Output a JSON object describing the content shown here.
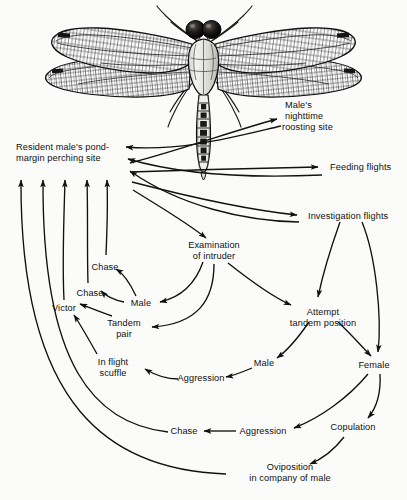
{
  "figure": {
    "type": "flow-diagram",
    "background_color": "#fbfbfa",
    "ink_color": "#111111"
  },
  "illustration": {
    "name": "dragonfly",
    "description": "Dorsal view line engraving of a dragonfly with four veined wings, dark compound eyes and a long segmented abdomen"
  },
  "nodes": [
    {
      "id": "perching",
      "lines": [
        "Resident male's pond-",
        "margin perching site"
      ],
      "x": 16,
      "y": 142,
      "align": "left"
    },
    {
      "id": "roosting",
      "lines": [
        "Male's",
        "nighttime",
        "roosting site"
      ],
      "x": 285,
      "y": 100,
      "align": "left"
    },
    {
      "id": "feeding",
      "lines": [
        "Feeding flights"
      ],
      "x": 330,
      "y": 165,
      "align": "left"
    },
    {
      "id": "investigation",
      "lines": [
        "Investigation flights"
      ],
      "x": 308,
      "y": 211,
      "align": "left"
    },
    {
      "id": "examination",
      "lines": [
        "Examination",
        "of intruder"
      ],
      "x": 214,
      "y": 245,
      "align": "center"
    },
    {
      "id": "chase_upper",
      "lines": [
        "Chase"
      ],
      "x": 105,
      "y": 262,
      "align": "center"
    },
    {
      "id": "chase_lower",
      "lines": [
        "Chase"
      ],
      "x": 90,
      "y": 290,
      "align": "center"
    },
    {
      "id": "victor",
      "lines": [
        "Victor"
      ],
      "x": 66,
      "y": 308,
      "align": "center"
    },
    {
      "id": "male_upper",
      "lines": [
        "Male"
      ],
      "x": 139,
      "y": 303,
      "align": "center"
    },
    {
      "id": "tandem_pair",
      "lines": [
        "Tandem",
        "pair"
      ],
      "x": 122,
      "y": 323,
      "align": "center"
    },
    {
      "id": "scuffle",
      "lines": [
        "In flight",
        "scuffle"
      ],
      "x": 111,
      "y": 362,
      "align": "center"
    },
    {
      "id": "attempt",
      "lines": [
        "Attempt",
        "tandem position"
      ],
      "x": 323,
      "y": 312,
      "align": "center"
    },
    {
      "id": "male_lower",
      "lines": [
        "Male"
      ],
      "x": 264,
      "y": 363,
      "align": "center"
    },
    {
      "id": "female",
      "lines": [
        "Female"
      ],
      "x": 374,
      "y": 365,
      "align": "center"
    },
    {
      "id": "aggression_u",
      "lines": [
        "Aggression"
      ],
      "x": 201,
      "y": 377,
      "align": "center"
    },
    {
      "id": "copulation",
      "lines": [
        "Copulation"
      ],
      "x": 353,
      "y": 427,
      "align": "center"
    },
    {
      "id": "aggression_l",
      "lines": [
        "Aggression"
      ],
      "x": 263,
      "y": 430,
      "align": "center"
    },
    {
      "id": "chase_bottom",
      "lines": [
        "Chase"
      ],
      "x": 184,
      "y": 430,
      "align": "center"
    },
    {
      "id": "oviposition",
      "lines": [
        "Oviposition",
        "in company of male"
      ],
      "x": 290,
      "y": 470,
      "align": "center"
    }
  ],
  "edges": [
    {
      "from": "perching",
      "to": "roosting",
      "bidirectional": true
    },
    {
      "from": "perching",
      "to": "feeding",
      "bidirectional": true
    },
    {
      "from": "perching",
      "to": "investigation",
      "bidirectional": true
    },
    {
      "from": "perching",
      "to": "examination",
      "bidirectional": false
    },
    {
      "from": "investigation",
      "to": "attempt",
      "bidirectional": false
    },
    {
      "from": "investigation",
      "to": "female",
      "bidirectional": false
    },
    {
      "from": "examination",
      "to": "male_upper",
      "bidirectional": false
    },
    {
      "from": "examination",
      "to": "tandem_pair",
      "bidirectional": false
    },
    {
      "from": "examination",
      "to": "attempt",
      "bidirectional": false
    },
    {
      "from": "male_upper",
      "to": "chase_upper",
      "bidirectional": false
    },
    {
      "from": "male_upper",
      "to": "chase_lower",
      "bidirectional": false
    },
    {
      "from": "tandem_pair",
      "to": "victor",
      "bidirectional": false
    },
    {
      "from": "scuffle",
      "to": "victor",
      "bidirectional": false
    },
    {
      "from": "attempt",
      "to": "male_lower",
      "bidirectional": false
    },
    {
      "from": "attempt",
      "to": "female",
      "bidirectional": false
    },
    {
      "from": "male_lower",
      "to": "aggression_u",
      "bidirectional": false
    },
    {
      "from": "aggression_u",
      "to": "scuffle",
      "bidirectional": false
    },
    {
      "from": "female",
      "to": "aggression_l",
      "bidirectional": false
    },
    {
      "from": "female",
      "to": "copulation",
      "bidirectional": false
    },
    {
      "from": "aggression_l",
      "to": "chase_bottom",
      "bidirectional": false
    },
    {
      "from": "copulation",
      "to": "oviposition",
      "bidirectional": false
    },
    {
      "from": "chase_upper",
      "to": "perching",
      "bidirectional": false
    },
    {
      "from": "chase_lower",
      "to": "perching",
      "bidirectional": false
    },
    {
      "from": "victor",
      "to": "perching",
      "bidirectional": false
    },
    {
      "from": "chase_bottom",
      "to": "perching",
      "bidirectional": false
    },
    {
      "from": "oviposition",
      "to": "perching",
      "bidirectional": false
    }
  ]
}
